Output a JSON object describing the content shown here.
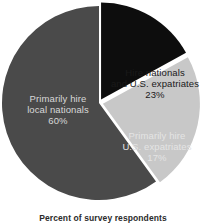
{
  "chart_data": {
    "type": "pie",
    "title": "",
    "subtitle": "",
    "caption": "Percent of survey respondents",
    "xlabel": "",
    "ylabel": "",
    "legend": "none",
    "grid": false,
    "units": "percent",
    "total": 100,
    "categories": [
      "Primarily hire local nationals",
      "Hire nationals and U.S. expatriates",
      "Primarily hire U.S. expatriates"
    ],
    "values": [
      60,
      23,
      17
    ],
    "value_labels": [
      "60%",
      "23%",
      "17%"
    ],
    "colors": [
      "#4a4a4a",
      "#c8c8c8",
      "#0d0d0d"
    ],
    "slices": [
      {
        "name": "primarily-hire-local-nationals",
        "label_line1": "Primarily hire",
        "label_line2": "local nationals",
        "value": 60,
        "value_label": "60%",
        "color": "#4a4a4a",
        "text_color": "#d8d8d8",
        "exploded": false
      },
      {
        "name": "hire-nationals-and-us-expatriates",
        "label_line1": "Hire nationals",
        "label_line2": "and U.S. expatriates",
        "value": 23,
        "value_label": "23%",
        "color": "#c8c8c8",
        "text_color": "#1a1a1a",
        "exploded": true
      },
      {
        "name": "primarily-hire-us-expatriates",
        "label_line1": "Primarily hire",
        "label_line2": "U.S. expatriates",
        "value": 17,
        "value_label": "17%",
        "color": "#0d0d0d",
        "text_color": "#e4e4e4",
        "exploded": true
      }
    ],
    "geometry": {
      "center_x": 99,
      "center_y": 103,
      "radius": 97,
      "start_angle_deg": -90,
      "direction": "counterclockwise",
      "explode_offset": 4
    },
    "background": "#ffffff"
  }
}
